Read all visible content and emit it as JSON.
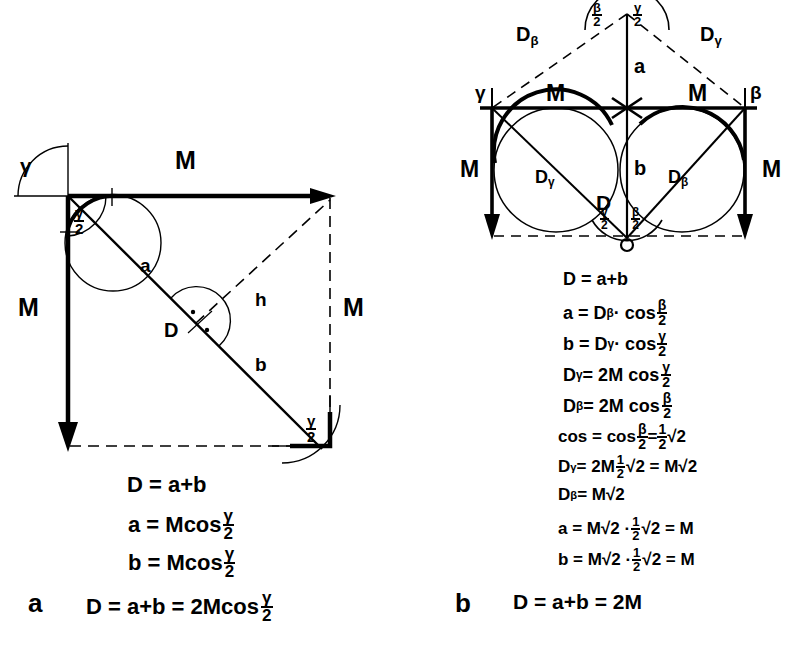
{
  "figure": {
    "panels": [
      {
        "id": "a",
        "label": "a"
      },
      {
        "id": "b",
        "label": "b"
      }
    ]
  },
  "panel_a": {
    "label": "a",
    "vectors": {
      "top_M": "M",
      "left_M": "M",
      "right_M": "M"
    },
    "segments": {
      "a": "a",
      "b": "b",
      "h": "h",
      "D": "D"
    },
    "angles": {
      "gamma": "γ",
      "gamma_half_top": {
        "num": "γ",
        "den": "2"
      },
      "gamma_half_bottom": {
        "num": "γ",
        "den": "2"
      }
    },
    "equations": [
      {
        "id": "a-eq-1",
        "text": "D = a+b"
      },
      {
        "id": "a-eq-2",
        "lhs": "a = Mcos",
        "frac": {
          "num": "γ",
          "den": "2"
        }
      },
      {
        "id": "a-eq-3",
        "lhs": "b = Mcos",
        "frac": {
          "num": "γ",
          "den": "2"
        }
      },
      {
        "id": "a-eq-4",
        "lhs": "D = a+b = 2Mcos",
        "frac": {
          "num": "γ",
          "den": "2"
        }
      }
    ]
  },
  "panel_b": {
    "label": "b",
    "vectors": {
      "top_left_M": "M",
      "top_right_M": "M",
      "left_M": "M",
      "right_M": "M"
    },
    "dashed_labels": {
      "upper_left": {
        "base": "D",
        "sub": "β"
      },
      "upper_right": {
        "base": "D",
        "sub": "γ"
      }
    },
    "circle_labels": {
      "left": {
        "base": "D",
        "sub": "γ"
      },
      "right": {
        "base": "D",
        "sub": "β"
      }
    },
    "segments": {
      "a": "a",
      "b": "b",
      "D": "D"
    },
    "corner_angles": {
      "left": "γ",
      "right": "β"
    },
    "apex_angles": {
      "left": {
        "num": "β",
        "den": "2"
      },
      "right": {
        "num": "γ",
        "den": "2"
      }
    },
    "bottom_angles": {
      "left": {
        "num": "γ",
        "den": "2"
      },
      "right": {
        "num": "β",
        "den": "2"
      }
    },
    "equations": [
      {
        "id": "b-eq-1",
        "text": "D = a+b"
      },
      {
        "id": "b-eq-2",
        "lhs": "a = D",
        "lhs_sub": "β",
        "mid": " · cos",
        "frac": {
          "num": "β",
          "den": "2"
        }
      },
      {
        "id": "b-eq-3",
        "lhs": "b = D",
        "lhs_sub": "γ",
        "mid": " · cos",
        "frac": {
          "num": "γ",
          "den": "2"
        }
      },
      {
        "id": "b-eq-4",
        "lhs": "D",
        "lhs_sub": "γ",
        "mid": "= 2M cos",
        "frac": {
          "num": "γ",
          "den": "2"
        }
      },
      {
        "id": "b-eq-5",
        "lhs": "D",
        "lhs_sub": "β",
        "mid": "= 2M cos",
        "frac": {
          "num": "β",
          "den": "2"
        }
      },
      {
        "id": "b-eq-6",
        "lhs": "cos = cos",
        "frac": {
          "num": "β",
          "den": "2"
        },
        "mid2": " = ",
        "frac2": {
          "num": "1",
          "den": "2"
        },
        "tail": "√2"
      },
      {
        "id": "b-eq-7",
        "lhs": "D",
        "lhs_sub": "γ",
        "mid": "= 2M",
        "frac": {
          "num": "1",
          "den": "2"
        },
        "tail": "√2 = M√2"
      },
      {
        "id": "b-eq-8",
        "lhs": "D",
        "lhs_sub": "β",
        "mid": "= M√2"
      },
      {
        "id": "b-eq-9",
        "lhs": "a = M√2 · ",
        "frac": {
          "num": "1",
          "den": "2"
        },
        "tail": "√2 = M"
      },
      {
        "id": "b-eq-10",
        "lhs": "b = M√2 · ",
        "frac": {
          "num": "1",
          "den": "2"
        },
        "tail": "√2 = M"
      },
      {
        "id": "b-eq-11",
        "text": "D = a+b = 2M"
      }
    ]
  }
}
